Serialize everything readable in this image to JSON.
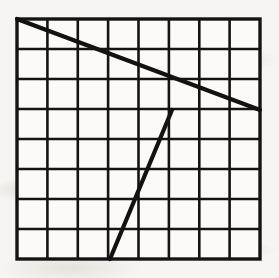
{
  "figure": {
    "title": "Square grid with two straight line segments",
    "canvas": {
      "width": 279,
      "height": 278
    },
    "background_color": "#f6f5f3",
    "ink_color": "#111111"
  },
  "grid": {
    "name": "square-grid",
    "columns": 8,
    "rows": 8,
    "left": 17,
    "top": 19,
    "right": 260,
    "bottom": 259,
    "cell_width": 30.375,
    "cell_height": 30,
    "x_positions": [
      17,
      47.4,
      77.8,
      108.1,
      138.5,
      168.9,
      199.3,
      229.6,
      260
    ],
    "y_positions": [
      19,
      49,
      79,
      109,
      139,
      169,
      199,
      229,
      259
    ],
    "line_color": "#141414",
    "inner_line_width": 2.6,
    "border_line_width": 3.4,
    "fill_color": "#fbfaf8"
  },
  "segments": [
    {
      "name": "descending-line",
      "label": "Descending segment",
      "start": {
        "x": 17,
        "y": 19,
        "grid_col": 0,
        "grid_row": 0
      },
      "end": {
        "x": 260,
        "y": 110,
        "grid_col": 8,
        "grid_row": 3
      },
      "passes_through": {
        "x": 169,
        "y": 79,
        "grid_col": 5,
        "grid_row": 2
      },
      "rise": 91,
      "run": 243,
      "slope": 0.374,
      "stroke_width": 4.2,
      "color": "#121212"
    },
    {
      "name": "ascending-line",
      "label": "Ascending segment",
      "start": {
        "x": 110,
        "y": 259,
        "grid_col": 3,
        "grid_row": 8
      },
      "end": {
        "x": 172,
        "y": 110,
        "grid_col": 5,
        "grid_row": 3
      },
      "rise": -149,
      "run": 62,
      "slope": -2.403,
      "stroke_width": 4.2,
      "color": "#121212"
    }
  ]
}
